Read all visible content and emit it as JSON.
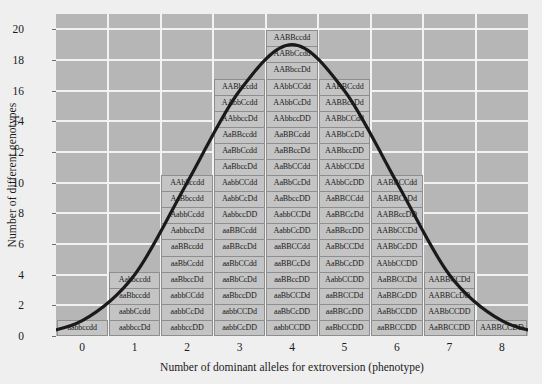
{
  "chart_data": {
    "type": "bar",
    "title": "",
    "xlabel": "Number of dominant alleles for extroversion (phenotype)",
    "ylabel": "Number of different genotypes",
    "categories": [
      "0",
      "1",
      "2",
      "3",
      "4",
      "5",
      "6",
      "7",
      "8"
    ],
    "values": [
      1,
      4,
      10,
      16,
      19,
      16,
      10,
      4,
      1
    ],
    "xlim": [
      -0.5,
      8.5
    ],
    "ylim": [
      0,
      21
    ],
    "ytick_labels": [
      "0",
      "2",
      "4",
      "6",
      "8",
      "10",
      "12",
      "14",
      "16",
      "18",
      "20"
    ],
    "ytick_values": [
      0,
      2,
      4,
      6,
      8,
      10,
      12,
      14,
      16,
      18,
      20
    ],
    "grid": true,
    "legend": "none",
    "overlay": "normal distribution bell curve",
    "colors": {
      "plot_background": "#b6b6b6",
      "gridline": "#f2f2f2",
      "cell_fill": "#c4c4c4",
      "cell_border": "#8e8e8e",
      "curve": "#1a1a1a",
      "page_background": "#efefef"
    },
    "columns": [
      {
        "x": "0",
        "count": 1,
        "genotypes": [
          "aabbccdd"
        ]
      },
      {
        "x": "1",
        "count": 4,
        "genotypes": [
          "aabbccDd",
          "aabbCcdd",
          "aaBbccdd",
          "Aabbccdd"
        ]
      },
      {
        "x": "2",
        "count": 10,
        "genotypes": [
          "aabbccDD",
          "aabbCcDd",
          "aabbCCdd",
          "aaBbccDd",
          "aaBbCcdd",
          "aaBBccdd",
          "AabbccDd",
          "AabbCcdd",
          "AaBbccdd",
          "AAbbccdd"
        ]
      },
      {
        "x": "3",
        "count": 16,
        "genotypes": [
          "aabbCcDD",
          "aabbCCDd",
          "aaBbccDD",
          "aaBbCcDd",
          "aaBbCCdd",
          "aaBBccDd",
          "aaBBCcdd",
          "AabbccDD",
          "AabbCcDd",
          "AabbCCdd",
          "AaBbccDd",
          "AaBbCcdd",
          "AaBBccdd",
          "AAbbccDd",
          "AAbbCcdd",
          "AABbccdd"
        ]
      },
      {
        "x": "4",
        "count": 19,
        "genotypes": [
          "aabbCCDD",
          "aaBbCcDD",
          "aaBbCCDd",
          "aaBBccDD",
          "aaBBCcDd",
          "aaBBCCdd",
          "AabbCcDD",
          "AabbCCDd",
          "AaBbccDD",
          "AaBbCcDd",
          "AaBbCCdd",
          "AaBBccDd",
          "AaBBCcdd",
          "AAbbccDD",
          "AAbbCcDd",
          "AAbbCCdd",
          "AABbccDd",
          "AABbCcdd",
          "AABBccdd"
        ]
      },
      {
        "x": "5",
        "count": 16,
        "genotypes": [
          "aaBbCCDD",
          "aaBBCcDD",
          "aaBBCCDd",
          "AabbCCDD",
          "AaBbCcDD",
          "AaBbCCDd",
          "AaBBccDD",
          "AaBBCcDd",
          "AaBBCCdd",
          "AAbbCcDD",
          "AAbbCCDd",
          "AABbccDD",
          "AABbCcDd",
          "AABbCCdd",
          "AABBccDd",
          "AABBCcdd"
        ]
      },
      {
        "x": "6",
        "count": 10,
        "genotypes": [
          "aaBBCCDD",
          "AaBbCCDD",
          "AaBBCcDD",
          "AaBBCCDd",
          "AAbbCCDD",
          "AABbCcDD",
          "AABbCCDd",
          "AABBccDD",
          "AABBCcDd",
          "AABBCCdd"
        ]
      },
      {
        "x": "7",
        "count": 4,
        "genotypes": [
          "AaBBCCDD",
          "AABbCCDD",
          "AABBCcDD",
          "AABBCCDd"
        ]
      },
      {
        "x": "8",
        "count": 1,
        "genotypes": [
          "AABBCCDD"
        ]
      }
    ]
  }
}
